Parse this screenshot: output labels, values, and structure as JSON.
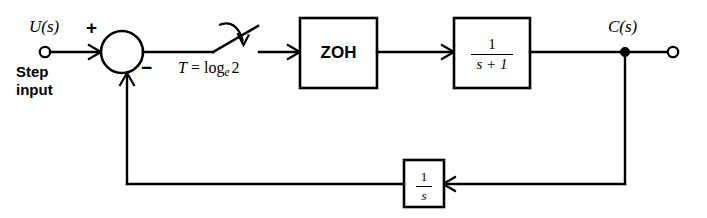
{
  "diagram": {
    "background_color": "#ffffff",
    "line_color": "#000000",
    "input": {
      "signal_label": "U(s)",
      "source_label_line1": "Step",
      "source_label_line2": "input",
      "terminal": "open-circle"
    },
    "summing_junction": {
      "plus_sign": "+",
      "minus_sign": "−",
      "plus_input": "U(s)",
      "minus_input": "feedback"
    },
    "sampler": {
      "label_T": "T",
      "label_equals": "=",
      "label_log": "log",
      "label_subscript": "e",
      "label_argument": "2",
      "full_label": "T = log_e 2",
      "type": "switch-sampler"
    },
    "blocks": [
      {
        "name": "zoh",
        "label": "ZOH",
        "kind": "text"
      },
      {
        "name": "plant",
        "numerator": "1",
        "denominator": "s + 1",
        "kind": "fraction"
      },
      {
        "name": "feedback",
        "numerator": "1",
        "denominator": "s",
        "kind": "fraction"
      }
    ],
    "output": {
      "signal_label": "C(s)",
      "terminal": "open-circle",
      "takeoff": "filled-dot"
    }
  }
}
